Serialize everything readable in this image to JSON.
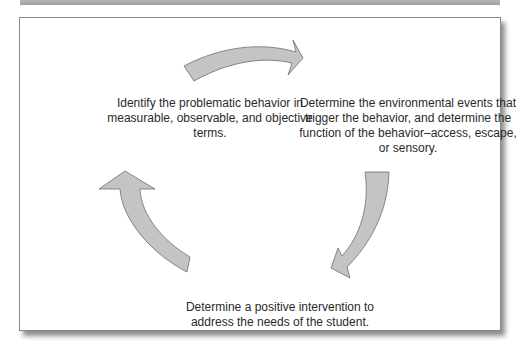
{
  "diagram": {
    "type": "cycle",
    "colors": {
      "arrow_fill": "#c4c4c4",
      "arrow_stroke": "#6e6e6e",
      "frame_border": "#8a8a8a",
      "top_bar": "#a8a8a8",
      "text": "#2a2a2a"
    },
    "steps": [
      {
        "text": "Identify the problematic behavior in measurable, observable, and objective terms."
      },
      {
        "text": "Determine the environmental events that trigger the behavior, and determine the function of the behavior–access, escape, or sensory."
      },
      {
        "text": "Determine a positive intervention to address the needs of the student."
      }
    ],
    "arrows": [
      {
        "from": "step-1",
        "to": "step-2",
        "direction": "clockwise",
        "icon": "curved-arrow-right"
      },
      {
        "from": "step-2",
        "to": "step-3",
        "direction": "clockwise",
        "icon": "curved-arrow-down-left"
      },
      {
        "from": "step-3",
        "to": "step-1",
        "direction": "clockwise",
        "icon": "curved-arrow-up"
      }
    ]
  }
}
